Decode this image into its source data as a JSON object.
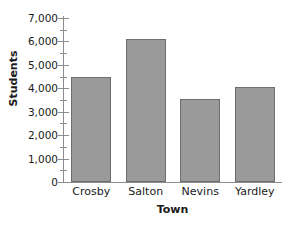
{
  "chart_data": {
    "type": "bar",
    "title": "",
    "subtitle": "",
    "xlabel": "Town",
    "ylabel": "Students",
    "categories": [
      "Crosby",
      "Salton",
      "Nevins",
      "Yardley"
    ],
    "values": [
      4500,
      6100,
      3550,
      4050
    ],
    "ylim": [
      0,
      7000
    ],
    "y_major_ticks": [
      0,
      1000,
      2000,
      3000,
      4000,
      5000,
      6000,
      7000
    ],
    "y_tick_labels": [
      "0",
      "1,000",
      "2,000",
      "3,000",
      "4,000",
      "5,000",
      "6,000",
      "7,000"
    ],
    "y_minor_ticks": [
      500,
      1500,
      2500,
      3500,
      4500,
      5500,
      6500
    ],
    "grid": false,
    "legend": null,
    "legend_position": "none",
    "series": [
      {
        "name": "Students",
        "values": [
          4500,
          6100,
          3550,
          4050
        ]
      }
    ],
    "colors": {
      "bar_fill": "#9a9a9a",
      "bar_border": "#6e6e6e",
      "axis": "#8c8c8c",
      "text": "#1a1a1a",
      "background": "#ffffff"
    }
  }
}
